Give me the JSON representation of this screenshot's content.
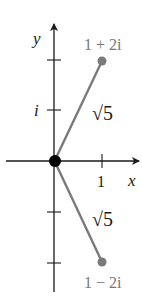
{
  "diagram": {
    "type": "complex-plane",
    "axes": {
      "x_label": "x",
      "y_label": "y",
      "x_tick_label": "1",
      "y_tick_label": "i"
    },
    "points": [
      {
        "label": "1 + 2i",
        "re": 1,
        "im": 2
      },
      {
        "label": "1 − 2i",
        "re": 1,
        "im": -2
      }
    ],
    "segment_labels": {
      "upper": "√5",
      "lower": "√5"
    },
    "colors": {
      "axis": "#1a1a1a",
      "segment": "#7a7a7a",
      "point": "#7a7a7a",
      "origin": "#000000",
      "point_label": "#777777",
      "text": "#1a1a1a"
    }
  }
}
